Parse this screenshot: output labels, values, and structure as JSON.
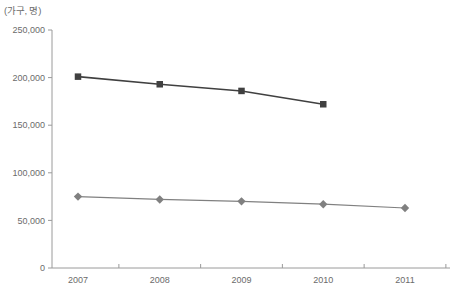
{
  "chart_data": {
    "type": "line",
    "title": "",
    "unit_label": "(가구, 명)",
    "xlabel": "",
    "ylabel": "",
    "categories": [
      "2007",
      "2008",
      "2009",
      "2010",
      "2011"
    ],
    "ylim": [
      0,
      250000
    ],
    "ytick_labels": [
      "0",
      "50,000",
      "100,000",
      "150,000",
      "200,000",
      "250,000"
    ],
    "ytick_values": [
      0,
      50000,
      100000,
      150000,
      200000,
      250000
    ],
    "grid": false,
    "legend": "none",
    "series": [
      {
        "name": "series-squares",
        "marker": "square",
        "color": "#404040",
        "values": [
          201000,
          193000,
          186000,
          172000,
          null
        ]
      },
      {
        "name": "series-diamonds",
        "marker": "diamond",
        "color": "#808080",
        "values": [
          75000,
          72000,
          70000,
          67000,
          63000
        ]
      }
    ]
  },
  "colors": {
    "axis": "#9a9a9a",
    "text": "#6b6b6b",
    "series_dark": "#404040",
    "series_light": "#808080",
    "background": "#ffffff"
  }
}
